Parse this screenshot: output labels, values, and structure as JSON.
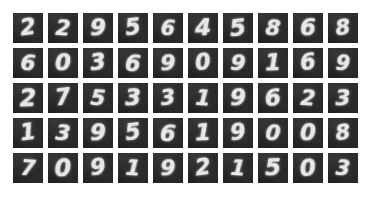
{
  "figure": {
    "name": "handwritten-digit-sample-grid",
    "type": "image-grid",
    "rows": 5,
    "columns": 10,
    "tile_count": 50,
    "background_color": "#ffffff",
    "tile_background_color": "#262626",
    "digit_stroke_color": "#e8e8e8"
  },
  "grid": {
    "rows": [
      {
        "row_index": 1,
        "digits": [
          "2",
          "2",
          "9",
          "5",
          "6",
          "4",
          "5",
          "8",
          "6",
          "8"
        ]
      },
      {
        "row_index": 2,
        "digits": [
          "6",
          "0",
          "3",
          "6",
          "9",
          "0",
          "9",
          "1",
          "6",
          "9"
        ]
      },
      {
        "row_index": 3,
        "digits": [
          "2",
          "7",
          "5",
          "3",
          "3",
          "1",
          "9",
          "6",
          "2",
          "3"
        ]
      },
      {
        "row_index": 4,
        "digits": [
          "1",
          "3",
          "9",
          "5",
          "6",
          "1",
          "9",
          "0",
          "0",
          "8"
        ]
      },
      {
        "row_index": 5,
        "digits": [
          "7",
          "0",
          "9",
          "1",
          "9",
          "2",
          "1",
          "5",
          "0",
          "3"
        ]
      }
    ]
  }
}
